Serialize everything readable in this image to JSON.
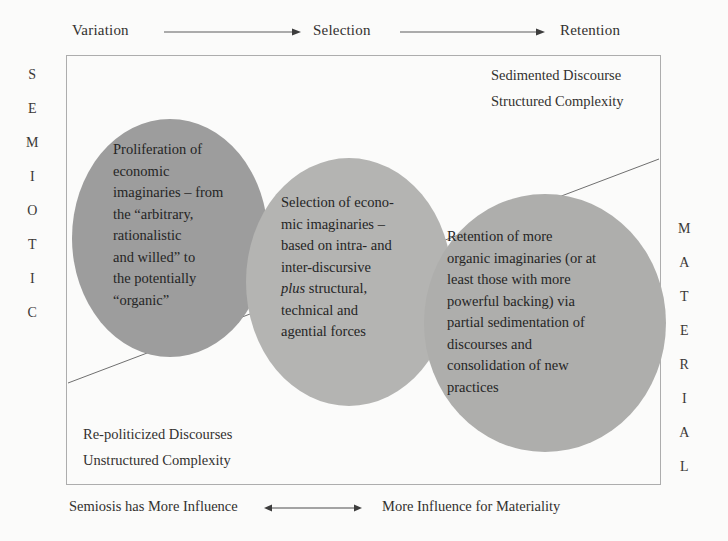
{
  "figure": {
    "header_flow": {
      "steps": [
        {
          "label": "Variation"
        },
        {
          "label": "Selection"
        },
        {
          "label": "Retention"
        }
      ],
      "arrow_icon": "arrow-right-icon"
    },
    "axis_labels": {
      "left_vertical": "SEMIOTIC",
      "right_vertical": "MATERIAL"
    },
    "corner_annotations": {
      "top_right_line_1": "Sedimented Discourse",
      "top_right_line_2": "Structured Complexity",
      "bottom_left_line_1": "Re-politicized Discourses",
      "bottom_left_line_2": "Unstructured Complexity"
    },
    "circles": [
      {
        "id": "variation",
        "fill": "#9d9d9d",
        "text_plain": "Proliferation of economic imaginaries – from the “arbitrary, rationalistic and willed” to the potentially “organic”",
        "lines": [
          "Proliferation of",
          "economic",
          "imaginaries – from",
          "the “arbitrary,",
          "rationalistic",
          "and willed” to",
          "the potentially",
          "“organic”"
        ]
      },
      {
        "id": "selection",
        "fill": "#b4b4b2",
        "text_plain": "Selection of economic imaginaries – based on intra- and inter-discursive plus structural, technical and agential forces",
        "italic_word": "plus",
        "lines": [
          "Selection of econo-",
          "mic imaginaries –",
          "based on intra- and",
          "inter-discursive",
          "plus structural,",
          "technical and",
          "agential forces"
        ]
      },
      {
        "id": "retention",
        "fill": "#aeaeac",
        "text_plain": "Retention of more organic imaginaries (or at least those with more powerful backing) via partial sedimentation of discourses and consolidation of new practices",
        "lines": [
          "Retention of more",
          "organic imaginaries (or at",
          "least those with more",
          "powerful backing) via",
          "partial sedimentation of",
          "discourses and",
          "consolidation of new",
          "practices"
        ]
      }
    ],
    "footer": {
      "left_label": "Semiosis has More Influence",
      "right_label": "More Influence for Materiality",
      "arrow_icon": "arrow-left-right-icon"
    },
    "colors": {
      "border": "#adadad",
      "diagonal_line": "#6f6f6f",
      "text": "#2b2b2b",
      "background": "#fbfbfa"
    }
  }
}
